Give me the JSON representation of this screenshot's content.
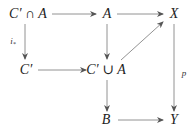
{
  "diagram": {
    "type": "commutative-diagram",
    "nodes": {
      "cap": "C′ ∩ A",
      "a": "A",
      "x": "X",
      "cprime": "C′",
      "cup": "C′ ∪ A",
      "b": "B",
      "y": "Y"
    },
    "labels": {
      "i_star": "i",
      "i_star_sub": "*",
      "p": "p"
    },
    "edges": [
      {
        "from": "C′ ∩ A",
        "to": "A",
        "label": ""
      },
      {
        "from": "A",
        "to": "X",
        "label": ""
      },
      {
        "from": "C′ ∩ A",
        "to": "C′",
        "label": "i*"
      },
      {
        "from": "A",
        "to": "C′ ∪ A",
        "label": ""
      },
      {
        "from": "C′ ∪ A",
        "to": "X",
        "label": ""
      },
      {
        "from": "X",
        "to": "Y",
        "label": "p"
      },
      {
        "from": "C′",
        "to": "C′ ∪ A",
        "label": ""
      },
      {
        "from": "C′ ∪ A",
        "to": "B",
        "label": ""
      },
      {
        "from": "B",
        "to": "Y",
        "label": ""
      }
    ],
    "colors": {
      "text": "#222222",
      "arrow": "#555555"
    }
  }
}
